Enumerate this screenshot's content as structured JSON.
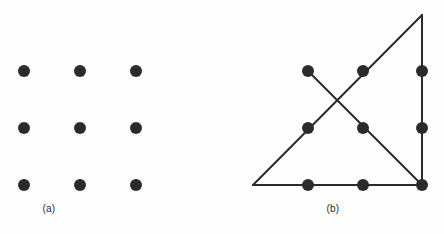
{
  "figure": {
    "type": "diagram",
    "name": "nine-dots-puzzle",
    "background_color": "#fefefe",
    "dot_color": "#2b2b2b",
    "line_color": "#2b2b2b",
    "dot_radius": 6,
    "line_width": 2,
    "width": 444,
    "height": 234
  },
  "panels": [
    {
      "id": "a",
      "caption": "(a)",
      "description": "three by three grid of nine dots",
      "dots": [
        {
          "name": "dot-r1c1",
          "x": 24,
          "y": 71
        },
        {
          "name": "dot-r1c2",
          "x": 80,
          "y": 71
        },
        {
          "name": "dot-r1c3",
          "x": 136,
          "y": 71
        },
        {
          "name": "dot-r2c1",
          "x": 24,
          "y": 128
        },
        {
          "name": "dot-r2c2",
          "x": 80,
          "y": 128
        },
        {
          "name": "dot-r2c3",
          "x": 136,
          "y": 128
        },
        {
          "name": "dot-r3c1",
          "x": 24,
          "y": 185
        },
        {
          "name": "dot-r3c2",
          "x": 80,
          "y": 185
        },
        {
          "name": "dot-r3c3",
          "x": 136,
          "y": 185
        }
      ],
      "lines": []
    },
    {
      "id": "b",
      "caption": "(b)",
      "description": "nine dot grid solved with four connected straight line segments extending outside the grid",
      "dots": [
        {
          "name": "dot-r1c1",
          "x": 86,
          "y": 71
        },
        {
          "name": "dot-r1c2",
          "x": 141,
          "y": 71
        },
        {
          "name": "dot-r1c3",
          "x": 200,
          "y": 71
        },
        {
          "name": "dot-r2c1",
          "x": 86,
          "y": 128
        },
        {
          "name": "dot-r2c2",
          "x": 141,
          "y": 128
        },
        {
          "name": "dot-r2c3",
          "x": 200,
          "y": 128
        },
        {
          "name": "dot-r3c1",
          "x": 86,
          "y": 185
        },
        {
          "name": "dot-r3c2",
          "x": 141,
          "y": 185
        },
        {
          "name": "dot-r3c3",
          "x": 200,
          "y": 185
        }
      ],
      "lines": [
        {
          "name": "line-bottom-horizontal",
          "x1": 31,
          "y1": 185,
          "x2": 200,
          "y2": 185
        },
        {
          "name": "line-hypotenuse",
          "x1": 31,
          "y1": 185,
          "x2": 200,
          "y2": 15
        },
        {
          "name": "line-right-vertical",
          "x1": 200,
          "y1": 15,
          "x2": 200,
          "y2": 185
        },
        {
          "name": "line-anti-diagonal",
          "x1": 86,
          "y1": 71,
          "x2": 200,
          "y2": 185
        }
      ]
    }
  ]
}
